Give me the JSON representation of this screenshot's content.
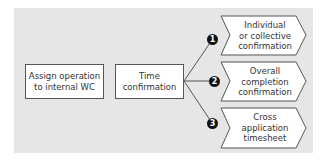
{
  "diagram": {
    "title": "",
    "steps": [
      {
        "id": "assign",
        "lines": [
          "Assign operation",
          "to internal WC"
        ]
      },
      {
        "id": "time",
        "lines": [
          "Time",
          "confirmation"
        ]
      }
    ],
    "options": [
      {
        "number": "1",
        "lines": [
          "Individual",
          "or collective",
          "confirmation"
        ]
      },
      {
        "number": "2",
        "lines": [
          "Overall",
          "completion",
          "confirmation"
        ]
      },
      {
        "number": "3",
        "lines": [
          "Cross",
          "application",
          "timesheet"
        ]
      }
    ],
    "colors": {
      "background": "#e6e6e6",
      "box_fill": "#ffffff",
      "border": "#555555",
      "badge": "#111111",
      "text": "#333333"
    }
  }
}
